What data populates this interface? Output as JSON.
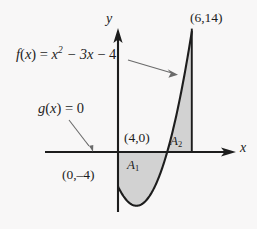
{
  "figure": {
    "background_color": "#f8f7f7",
    "ink_color": "#1d1d1d",
    "shade_color": "#d2d2d2"
  },
  "axes": {
    "y_axis_label": "y",
    "x_axis_label": "x",
    "origin_px": [
      118,
      152
    ],
    "x_unit_px": 12.3,
    "y_unit_px": 8.6
  },
  "labels": {
    "function_f": {
      "prefix": "f",
      "paren_open": "(",
      "variable": "x",
      "paren_close": ")",
      "equals": " = ",
      "term1": "x",
      "term1_exponent": "2",
      "term2": " − 3x",
      "term3": " − 4"
    },
    "function_g": {
      "prefix": "g",
      "paren_open": "(",
      "variable": "x",
      "paren_close": ")",
      "equals": " = 0"
    },
    "point_top_right": "(6,14)",
    "point_x_intercept": "(4,0)",
    "point_y_intercept": "(0,–4)",
    "region_lower": {
      "name": "A",
      "index": "1"
    },
    "region_upper": {
      "name": "A",
      "index": "2"
    }
  },
  "chart_data": {
    "type": "line",
    "xlabel": "x",
    "ylabel": "y",
    "xlim": [
      -6,
      9
    ],
    "ylim": [
      -6,
      16
    ],
    "grid": false,
    "legend": "none",
    "series": [
      {
        "name": "f(x) = x^2 - 3x - 4",
        "expression": "x^2 - 3x - 4",
        "x": [
          0,
          0.5,
          1,
          1.5,
          2,
          2.5,
          3,
          3.5,
          4,
          4.5,
          5,
          5.5,
          6
        ],
        "y": [
          -4,
          -5.25,
          -6,
          -6.25,
          -6,
          -5.25,
          -4,
          -2.25,
          0,
          2.75,
          6,
          9.75,
          14
        ]
      },
      {
        "name": "g(x) = 0",
        "expression": "0",
        "x": [
          -6,
          9
        ],
        "y": [
          0,
          0
        ]
      }
    ],
    "annotations": [
      {
        "text": "(6,14)",
        "x": 6,
        "y": 14
      },
      {
        "text": "(4,0)",
        "x": 4,
        "y": 0
      },
      {
        "text": "(0,–4)",
        "x": 0,
        "y": -4
      },
      {
        "text": "A₁",
        "x": 2,
        "y": -3,
        "note": "region between x=0 and x=4, below x-axis"
      },
      {
        "text": "A₂",
        "x": 5.2,
        "y": 4,
        "note": "region between x=4 and x=6, above x-axis"
      }
    ]
  }
}
